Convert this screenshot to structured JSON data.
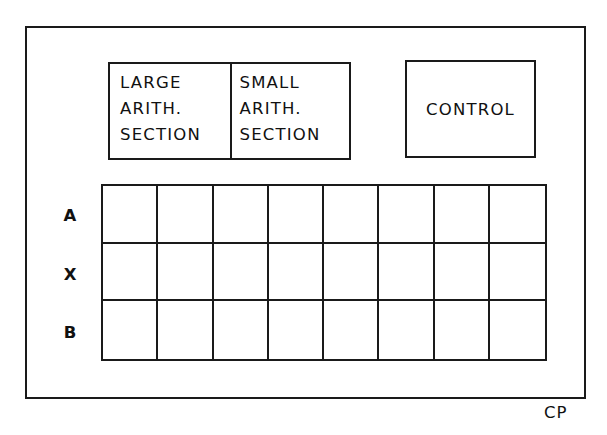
{
  "diagram": {
    "frame_label": "CP",
    "arithmetic_unit": {
      "sections": [
        {
          "name": "large",
          "lines": [
            "LARGE",
            "ARITH.",
            "SECTION"
          ]
        },
        {
          "name": "small",
          "lines": [
            "SMALL",
            "ARITH.",
            "SECTION"
          ]
        }
      ]
    },
    "control": {
      "label": "CONTROL"
    },
    "register_grid": {
      "rows": [
        {
          "label": "A",
          "cells": 8
        },
        {
          "label": "X",
          "cells": 8
        },
        {
          "label": "B",
          "cells": 8
        }
      ],
      "columns": 8
    },
    "colors": {
      "line": "#1a1a1a",
      "background": "#ffffff"
    }
  }
}
